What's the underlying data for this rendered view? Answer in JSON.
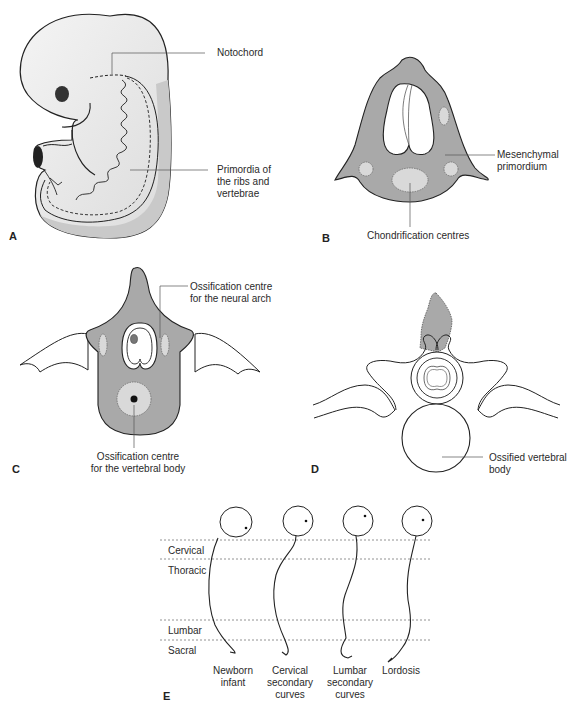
{
  "figure": {
    "panels": [
      {
        "id": "A",
        "letter": "A",
        "labels": {
          "notochord": "Notochord",
          "primordia": "Primordia of\nthe ribs and\nvertebrae"
        }
      },
      {
        "id": "B",
        "letter": "B",
        "labels": {
          "mesenchymal": "Mesenchymal\nprimordium",
          "chondrification": "Chondrification centres"
        }
      },
      {
        "id": "C",
        "letter": "C",
        "labels": {
          "neural_arch": "Ossification centre\nfor the neural arch",
          "vertebral_body": "Ossification centre\nfor the vertebral body"
        }
      },
      {
        "id": "D",
        "letter": "D",
        "labels": {
          "ossified_body": "Ossified vertebral\nbody"
        }
      },
      {
        "id": "E",
        "letter": "E",
        "regions": [
          "Cervical",
          "Thoracic",
          "Lumbar",
          "Sacral"
        ],
        "stages": [
          "Newborn\ninfant",
          "Cervical\nsecondary\ncurves",
          "Lumbar\nsecondary\ncurves",
          "Lordosis"
        ]
      }
    ],
    "colors": {
      "tissue_gray": "#a9a9a9",
      "light_gray": "#d9d9d9",
      "embryo_fill": "#ececec",
      "outline": "#222222"
    }
  }
}
